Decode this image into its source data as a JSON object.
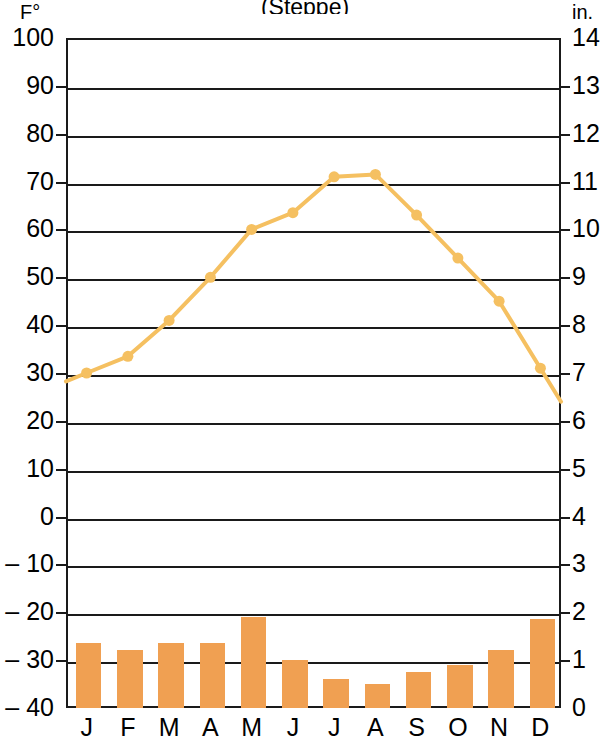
{
  "title": "(Steppe)",
  "axes": {
    "left_unit": "F°",
    "right_unit": "in.",
    "left_ticks": [
      "100",
      "90",
      "80",
      "70",
      "60",
      "50",
      "40",
      "30",
      "20",
      "10",
      "0",
      "– 10",
      "– 20",
      "– 30",
      "– 40"
    ],
    "right_ticks": [
      "14",
      "13",
      "12",
      "11",
      "10",
      "9",
      "8",
      "7",
      "6",
      "5",
      "4",
      "3",
      "2",
      "1",
      "0"
    ]
  },
  "colors": {
    "bar": "#f0a052",
    "line": "#f5c061",
    "axis": "#1a1a1a",
    "background": "#ffffff"
  },
  "chart_data": {
    "type": "line",
    "title": "(Steppe)",
    "xlabel": "",
    "ylabel": "F°",
    "y2label": "in.",
    "grid": true,
    "legend": "none",
    "categories": [
      "J",
      "F",
      "M",
      "A",
      "M",
      "J",
      "J",
      "A",
      "S",
      "O",
      "N",
      "D"
    ],
    "ylim": [
      -40,
      100
    ],
    "y2lim": [
      0,
      14
    ],
    "series": [
      {
        "name": "Temperature",
        "type": "line",
        "axis": "left",
        "unit": "F°",
        "color": "#f5c061",
        "values": [
          30,
          33.5,
          41,
          50,
          60,
          63.5,
          71,
          71.5,
          63,
          54,
          45,
          31
        ]
      },
      {
        "name": "Precipitation",
        "type": "bar",
        "axis": "right",
        "unit": "in.",
        "color": "#f0a052",
        "values": [
          1.4,
          1.25,
          1.4,
          1.4,
          1.95,
          1.05,
          0.65,
          0.55,
          0.8,
          0.95,
          1.25,
          1.9
        ]
      }
    ]
  }
}
